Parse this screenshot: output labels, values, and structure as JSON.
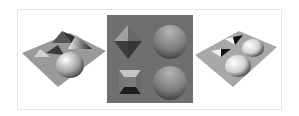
{
  "figure": {
    "panels": [
      {
        "id": "left",
        "description": "3D rendered surface with pyramids, cone and hemisphere bumps on a tilted plane"
      },
      {
        "id": "middle",
        "description": "Shaded gray image: pyramid, sphere, inverted pyramid pit, sphere"
      },
      {
        "id": "right",
        "description": "3D rendered surface with pits and hemispherical dents on a tilted plane"
      }
    ],
    "colors": {
      "middle_background": "#6f6f6f",
      "frame_border": "#e6e6e6"
    }
  }
}
